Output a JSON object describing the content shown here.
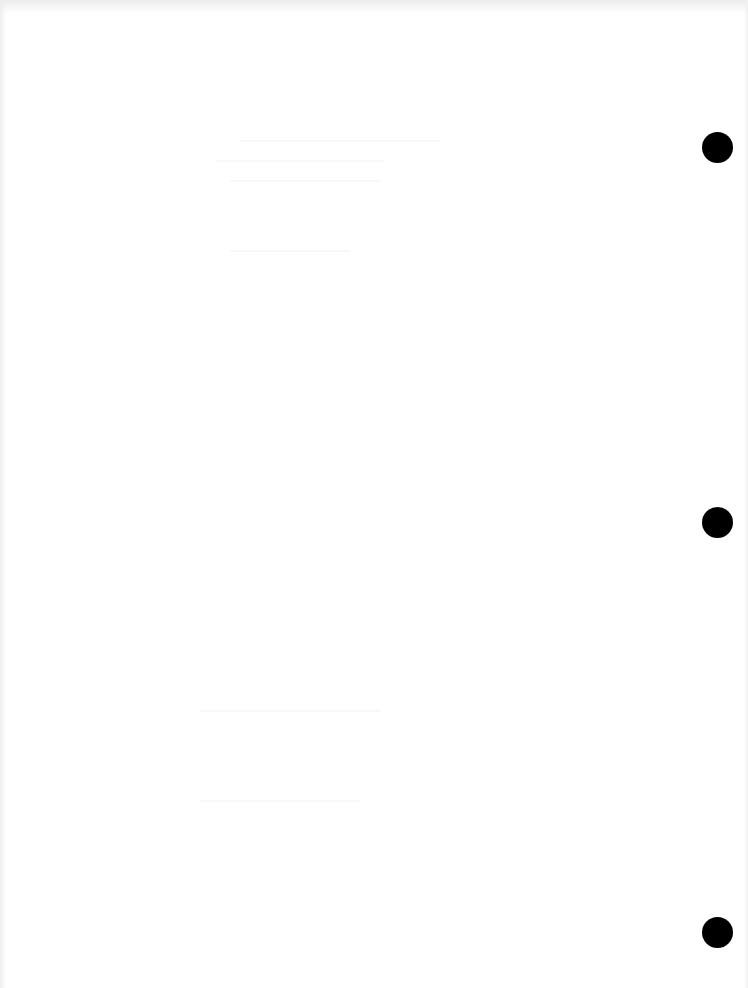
{
  "document": {
    "type": "scanned blank page",
    "background_color": "#ffffff",
    "visible_text": ""
  },
  "punch_holes": [
    {
      "cx": 717,
      "cy": 147,
      "diameter": 31,
      "color": "#000000"
    },
    {
      "cx": 717,
      "cy": 522,
      "diameter": 31,
      "color": "#000000"
    },
    {
      "cx": 717,
      "cy": 932,
      "diameter": 31,
      "color": "#000000"
    }
  ]
}
